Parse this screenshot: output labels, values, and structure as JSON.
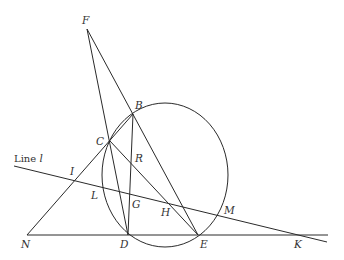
{
  "diagram": {
    "type": "geometry",
    "stroke_color": "#2a2a2a",
    "label_color": "#333333",
    "line_label": {
      "prefix": "Line ",
      "name": "l"
    },
    "circle": {
      "cx": 165,
      "cy": 175,
      "rx": 63,
      "ry": 72
    },
    "points": {
      "F": {
        "label": "F",
        "x": 87,
        "y": 29
      },
      "B": {
        "label": "B",
        "x": 133,
        "y": 114
      },
      "C": {
        "label": "C",
        "x": 110,
        "y": 141
      },
      "R": {
        "label": "R",
        "x": 131,
        "y": 157
      },
      "I": {
        "label": "I",
        "x": 74,
        "y": 180
      },
      "L": {
        "label": "L",
        "x": 101,
        "y": 187
      },
      "G": {
        "label": "G",
        "x": 129,
        "y": 194
      },
      "H": {
        "label": "H",
        "x": 171,
        "y": 203
      },
      "M": {
        "label": "M",
        "x": 217,
        "y": 215
      },
      "N": {
        "label": "N",
        "x": 27,
        "y": 235
      },
      "D": {
        "label": "D",
        "x": 128,
        "y": 235
      },
      "E": {
        "label": "E",
        "x": 198,
        "y": 235
      },
      "K": {
        "label": "K",
        "x": 303,
        "y": 235
      }
    },
    "segments": [
      [
        "F",
        "B"
      ],
      [
        "F",
        "D"
      ],
      [
        "B",
        "E"
      ],
      [
        "B",
        "D"
      ],
      [
        "C",
        "E"
      ],
      [
        "N",
        "B"
      ],
      [
        "N",
        "K-end"
      ],
      [
        "line-l"
      ]
    ]
  }
}
